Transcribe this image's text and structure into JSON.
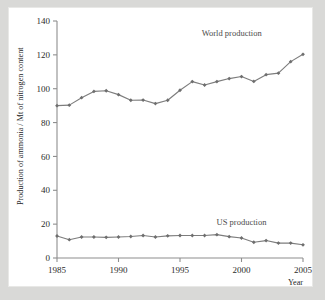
{
  "figure": {
    "background_color": "#d9d9d7",
    "panel_color": "#ffffff",
    "series_color": "#7d7d7d"
  },
  "chart_data": {
    "type": "line",
    "title": "",
    "xlabel": "Year",
    "ylabel": "Production of ammonia / Mt of nitrogen content",
    "xlim": [
      1985,
      2005
    ],
    "ylim": [
      0,
      140
    ],
    "xticks": [
      1985,
      1990,
      1995,
      2000,
      2005
    ],
    "yticks": [
      0,
      20,
      40,
      60,
      80,
      100,
      120,
      140
    ],
    "grid": false,
    "legend": "inline-annotations",
    "marker": "diamond",
    "x": [
      1985,
      1986,
      1987,
      1988,
      1989,
      1990,
      1991,
      1992,
      1993,
      1994,
      1995,
      1996,
      1997,
      1998,
      1999,
      2000,
      2001,
      2002,
      2003,
      2004,
      2005
    ],
    "series": [
      {
        "name": "World production",
        "label_x": 1999.2,
        "label_y": 131,
        "values": [
          90,
          90.3,
          94.7,
          98.4,
          98.8,
          96.5,
          93.2,
          93.3,
          91.2,
          93.2,
          99.1,
          104.2,
          102.2,
          104.2,
          106.0,
          107.2,
          104.3,
          108.3,
          109.2,
          116.0,
          120.3
        ]
      },
      {
        "name": "US production",
        "label_x": 2000.0,
        "label_y": 19.5,
        "values": [
          13.0,
          10.8,
          12.4,
          12.4,
          12.2,
          12.4,
          12.7,
          13.3,
          12.4,
          13.1,
          13.3,
          13.3,
          13.3,
          13.8,
          12.6,
          11.8,
          9.3,
          10.3,
          8.8,
          8.8,
          7.8
        ]
      }
    ],
    "annotations": [
      {
        "text": "World production"
      },
      {
        "text": "US production"
      }
    ]
  }
}
